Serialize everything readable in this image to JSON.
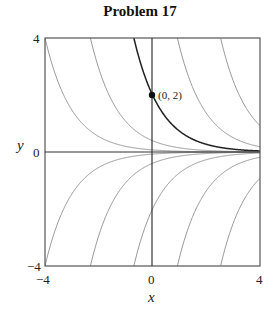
{
  "chart_data": {
    "type": "line",
    "title": "Problem 17",
    "xlabel": "x",
    "ylabel": "y",
    "xlim": [
      -4,
      4
    ],
    "ylim": [
      -4,
      4
    ],
    "x_ticks": [
      "−4",
      "0",
      "4"
    ],
    "y_ticks": [
      "4",
      "0",
      "−4"
    ],
    "grid": false,
    "legend": null,
    "series": [
      {
        "name": "C=0.0733",
        "formula": "0.0733*exp(-x)",
        "style": "thin"
      },
      {
        "name": "C=0.397",
        "formula": "0.397*exp(-x)",
        "style": "thin"
      },
      {
        "name": "C=2 (through (0,2))",
        "formula": "2*exp(-x)",
        "style": "bold"
      },
      {
        "name": "C=10.1",
        "formula": "10.1*exp(-x)",
        "style": "thin"
      },
      {
        "name": "C=50.4",
        "formula": "50.4*exp(-x)",
        "style": "thin"
      },
      {
        "name": "C=-0.0733",
        "formula": "-0.0733*exp(-x)",
        "style": "thin"
      },
      {
        "name": "C=-0.397",
        "formula": "-0.397*exp(-x)",
        "style": "thin"
      },
      {
        "name": "C=-2",
        "formula": "-2*exp(-x)",
        "style": "thin"
      },
      {
        "name": "C=-10.1",
        "formula": "-10.1*exp(-x)",
        "style": "thin"
      },
      {
        "name": "C=-50.4",
        "formula": "-50.4*exp(-x)",
        "style": "thin"
      }
    ],
    "coefficients": [
      0.0733,
      0.397,
      2,
      10.1,
      50.4,
      -0.0733,
      -0.397,
      -2,
      -10.1,
      -50.4
    ],
    "highlight_index": 2,
    "annotations": [
      {
        "text": "(0, 2)",
        "x": 0,
        "y": 2,
        "marker": "filled-circle"
      }
    ]
  }
}
